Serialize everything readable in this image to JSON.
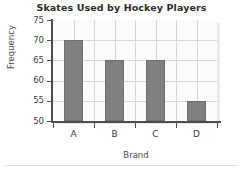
{
  "chart_data": {
    "type": "bar",
    "title": "Skates Used by Hockey Players",
    "xlabel": "Brand",
    "ylabel": "Frequency",
    "categories": [
      "A",
      "B",
      "C",
      "D"
    ],
    "values": [
      70,
      65,
      65,
      55
    ],
    "ylim": [
      50,
      75
    ],
    "yticks": [
      50,
      55,
      60,
      65,
      70,
      75
    ],
    "ytick_labels": [
      "50",
      "55",
      "60",
      "65",
      "70",
      "75"
    ],
    "grid": true,
    "grid_axis": "both",
    "legend": false,
    "legend_position": "none",
    "bar_color": "#808080",
    "bar_edge_color": "#6f6f6f",
    "grid_color": "#d6d6d6",
    "axis_color": "#4d4d4d",
    "plot_background": "#fbfbfb",
    "figure_background": "#ffffff",
    "title_color": "#2b2b2b",
    "label_color": "#4a4a4a"
  }
}
